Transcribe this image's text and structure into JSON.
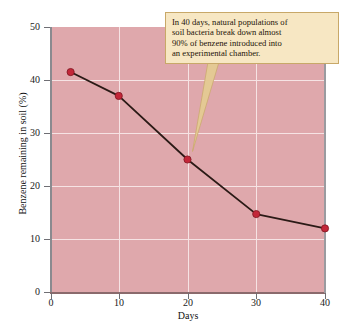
{
  "chart_data": {
    "type": "line",
    "title": "",
    "xlabel": "Days",
    "ylabel": "Benzene remaining in soil (%)",
    "xlim": [
      0,
      40
    ],
    "ylim": [
      0,
      50
    ],
    "xticks": [
      0,
      10,
      20,
      30,
      40
    ],
    "yticks": [
      0,
      10,
      20,
      30,
      40,
      50
    ],
    "grid": true,
    "legend": "none",
    "x": [
      3,
      10,
      20,
      30,
      40
    ],
    "values": [
      41.5,
      37,
      25,
      14.7,
      12
    ],
    "series": [
      {
        "name": "Benzene remaining in soil",
        "x": [
          3,
          10,
          20,
          30,
          40
        ],
        "values": [
          41.5,
          37,
          25,
          14.7,
          12
        ]
      }
    ],
    "annotations": [
      {
        "text": "In 40 days, natural populations of soil bacteria break down almost 90% of benzene introduced into an experimental chamber.",
        "points_to_x": 20,
        "points_to_y": 25
      }
    ],
    "colors": {
      "plot_background": "#dfa8ac",
      "gridline": "#f6e3e4",
      "line": "#2b1a16",
      "marker": "#c32638",
      "marker_edge": "#7d1420",
      "annotation_fill": "#f7e7c3",
      "annotation_border": "#c8a868",
      "axis": "#6f6f74",
      "figure_background": "#ffffff"
    }
  },
  "axes": {
    "y_title": "Benzene remaining in soil (%)",
    "x_title": "Days",
    "y_labels": [
      "50",
      "40",
      "30",
      "20",
      "10",
      "0"
    ],
    "x_labels": [
      "0",
      "10",
      "20",
      "30",
      "40"
    ]
  },
  "annotation": {
    "line1": "In 40 days, natural populations of",
    "line2": "soil bacteria break down almost",
    "line3": "90% of benzene introduced into",
    "line4": "an experimental chamber.",
    "full_text": "In 40 days, natural populations of soil bacteria break down almost 90% of benzene introduced into an experimental chamber."
  }
}
